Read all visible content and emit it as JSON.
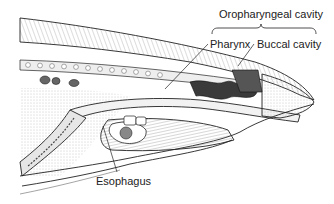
{
  "diagram": {
    "labels": {
      "oropharyngeal": "Oropharyngeal cavity",
      "pharynx": "Pharynx",
      "buccal": "Buccal cavity",
      "esophagus": "Esophagus"
    },
    "colors": {
      "ink": "#222222",
      "shade": "#8a8a8a",
      "light": "#d8d8d8",
      "background": "#ffffff"
    }
  }
}
